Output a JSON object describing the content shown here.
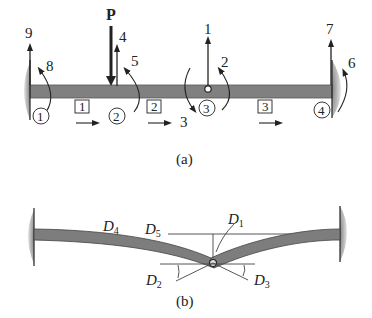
{
  "figure_a": {
    "caption": "(a)",
    "load_label": "P",
    "dof_labels": {
      "d1": "1",
      "d2": "2",
      "d3": "3",
      "d4": "4",
      "d5": "5",
      "d6": "6",
      "d7": "7",
      "d8": "8",
      "d9": "9"
    },
    "node_labels": [
      "1",
      "2",
      "3",
      "4"
    ],
    "element_labels": [
      "1",
      "2",
      "3"
    ]
  },
  "figure_b": {
    "caption": "(b)",
    "displacement_labels": [
      {
        "main": "D",
        "sub": "1"
      },
      {
        "main": "D",
        "sub": "2"
      },
      {
        "main": "D",
        "sub": "3"
      },
      {
        "main": "D",
        "sub": "4"
      },
      {
        "main": "D",
        "sub": "5"
      }
    ]
  },
  "colors": {
    "beam": "#7a7a7a",
    "beam_edge": "#444444",
    "support": "#9a9a9a",
    "line": "#222222"
  }
}
